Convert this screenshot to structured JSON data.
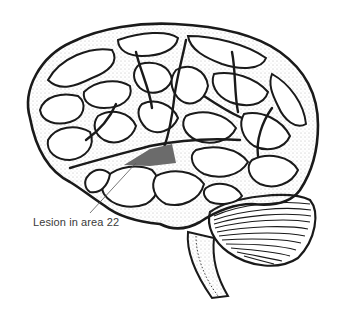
{
  "figure": {
    "annotation": {
      "label": "Lesion in area 22",
      "region": "Superior temporal gyrus (Wernicke's area)"
    },
    "colors": {
      "background": "#ffffff",
      "ink": "#1a1a1a",
      "stipple": "#555555",
      "lesion_fill": "#6b6b6b",
      "label_text": "#3a3a3a"
    }
  }
}
